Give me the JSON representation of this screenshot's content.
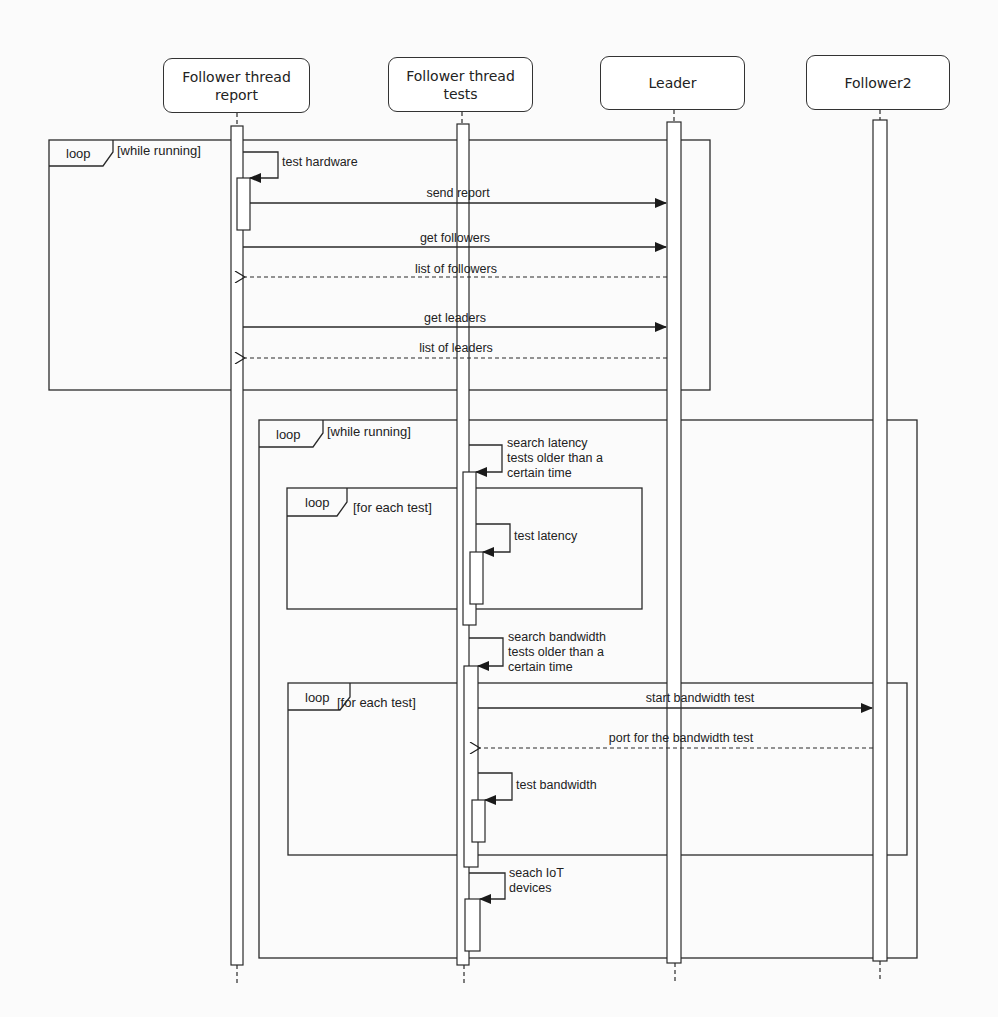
{
  "diagram": {
    "type": "UML sequence diagram",
    "lifelines": [
      {
        "id": "report",
        "label": "Follower thread\nreport"
      },
      {
        "id": "tests",
        "label": "Follower thread\ntests"
      },
      {
        "id": "leader",
        "label": "Leader"
      },
      {
        "id": "follower2",
        "label": "Follower2"
      }
    ],
    "fragments": [
      {
        "id": "loop1",
        "operator": "loop",
        "guard": "[while running]"
      },
      {
        "id": "loop2",
        "operator": "loop",
        "guard": "[while running]"
      },
      {
        "id": "loop3",
        "operator": "loop",
        "guard": "[for each test]"
      },
      {
        "id": "loop4",
        "operator": "loop",
        "guard": "[for each test]"
      }
    ],
    "messages": [
      {
        "label": "test hardware",
        "from": "report",
        "to": "report",
        "kind": "self"
      },
      {
        "label": "send report",
        "from": "report",
        "to": "leader",
        "kind": "sync"
      },
      {
        "label": "get followers",
        "from": "report",
        "to": "leader",
        "kind": "sync"
      },
      {
        "label": "list of followers",
        "from": "leader",
        "to": "report",
        "kind": "return"
      },
      {
        "label": "get leaders",
        "from": "report",
        "to": "leader",
        "kind": "sync"
      },
      {
        "label": "list of leaders",
        "from": "leader",
        "to": "report",
        "kind": "return"
      },
      {
        "label": "search latency\ntests older than a\ncertain time",
        "from": "tests",
        "to": "tests",
        "kind": "self"
      },
      {
        "label": "test latency",
        "from": "tests",
        "to": "tests",
        "kind": "self"
      },
      {
        "label": "search bandwidth\ntests older than a\ncertain time",
        "from": "tests",
        "to": "tests",
        "kind": "self"
      },
      {
        "label": "start bandwidth test",
        "from": "tests",
        "to": "follower2",
        "kind": "sync"
      },
      {
        "label": "port for the bandwidth test",
        "from": "follower2",
        "to": "tests",
        "kind": "return"
      },
      {
        "label": "test bandwidth",
        "from": "tests",
        "to": "tests",
        "kind": "self"
      },
      {
        "label": "seach IoT\ndevices",
        "from": "tests",
        "to": "tests",
        "kind": "self"
      }
    ]
  }
}
